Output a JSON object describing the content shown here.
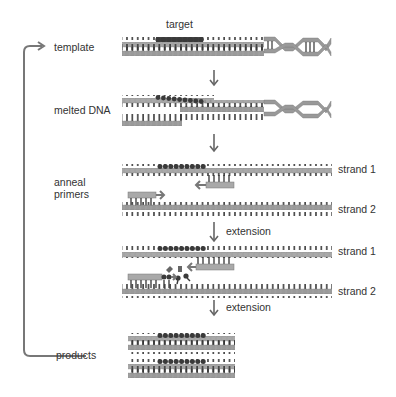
{
  "figure": {
    "colors": {
      "backbone_light": "#b8b8b8",
      "backbone_mid": "#8f8f8f",
      "backbone_dark": "#6e6e6e",
      "target": "#3a3a3a",
      "rung": "#333333",
      "arrow": "#666666",
      "text": "#333333"
    }
  },
  "labels": {
    "target": "target",
    "template": "template",
    "melted_dna": "melted DNA",
    "anneal_primers": "anneal\nprimers",
    "extension_1": "extension",
    "extension_2": "extension",
    "products": "products",
    "strand1_a": "strand 1",
    "strand2_a": "strand 2",
    "strand1_b": "strand 1",
    "strand2_b": "strand 2"
  },
  "steps": [
    {
      "name": "template"
    },
    {
      "name": "melted DNA"
    },
    {
      "name": "anneal primers"
    },
    {
      "name": "extension"
    },
    {
      "name": "products"
    }
  ]
}
